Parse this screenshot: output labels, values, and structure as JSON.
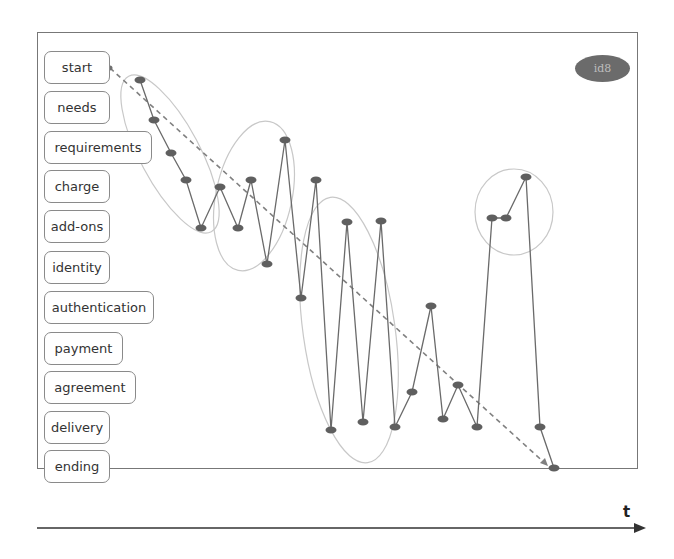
{
  "diagram": {
    "badge": "id8",
    "time_axis_label": "t",
    "stages": [
      {
        "label": "start",
        "y": 68,
        "width": 66
      },
      {
        "label": "needs",
        "y": 108,
        "width": 66
      },
      {
        "label": "requirements",
        "y": 148,
        "width": 108
      },
      {
        "label": "charge",
        "y": 187,
        "width": 66
      },
      {
        "label": "add-ons",
        "y": 227,
        "width": 66
      },
      {
        "label": "identity",
        "y": 268,
        "width": 66
      },
      {
        "label": "authentication",
        "y": 308,
        "width": 110
      },
      {
        "label": "payment",
        "y": 349,
        "width": 79
      },
      {
        "label": "agreement",
        "y": 388,
        "width": 92
      },
      {
        "label": "delivery",
        "y": 428,
        "width": 66
      },
      {
        "label": "ending",
        "y": 467,
        "width": 66
      }
    ],
    "path_nodes": [
      [
        140,
        80
      ],
      [
        154,
        120
      ],
      [
        171,
        153
      ],
      [
        186,
        180
      ],
      [
        201,
        228
      ],
      [
        220,
        187
      ],
      [
        238,
        228
      ],
      [
        251,
        180
      ],
      [
        267,
        264
      ],
      [
        285,
        140
      ],
      [
        301,
        298
      ],
      [
        316,
        180
      ],
      [
        331,
        430
      ],
      [
        347,
        222
      ],
      [
        363,
        422
      ],
      [
        381,
        221
      ],
      [
        395,
        427
      ],
      [
        412,
        392
      ],
      [
        431,
        306
      ],
      [
        443,
        419
      ],
      [
        458,
        385
      ],
      [
        477,
        427
      ],
      [
        492,
        218
      ],
      [
        506,
        218
      ],
      [
        526,
        177
      ],
      [
        540,
        427
      ],
      [
        554,
        468
      ]
    ],
    "trend_line": {
      "from": [
        110,
        68
      ],
      "to": [
        548,
        466
      ]
    },
    "clusters": [
      {
        "cx": 170,
        "cy": 154,
        "rx": 30,
        "ry": 88,
        "rot": -28
      },
      {
        "cx": 254,
        "cy": 196,
        "rx": 38,
        "ry": 76,
        "rot": 12
      },
      {
        "cx": 349,
        "cy": 330,
        "rx": 46,
        "ry": 134,
        "rot": -8
      },
      {
        "cx": 514,
        "cy": 212,
        "rx": 39,
        "ry": 43,
        "rot": 0
      }
    ],
    "colors": {
      "node": "#5f5f5f",
      "edge": "#6a6a6a",
      "cluster": "#c8c8c8",
      "trend": "#808080",
      "frame": "#777777"
    }
  }
}
